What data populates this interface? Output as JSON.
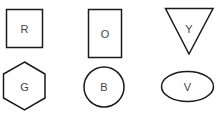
{
  "diagram": {
    "title": "",
    "colors": {
      "stroke": "#1a1a1a",
      "label": "#444444",
      "background": "#ffffff"
    },
    "shapes": [
      {
        "id": "square",
        "type": "square",
        "label": "R",
        "row": 1,
        "col": 1
      },
      {
        "id": "rectangle",
        "type": "rectangle",
        "label": "O",
        "row": 1,
        "col": 2
      },
      {
        "id": "triangle",
        "type": "inverted-triangle",
        "label": "Y",
        "row": 1,
        "col": 3
      },
      {
        "id": "hexagon",
        "type": "hexagon",
        "label": "G",
        "row": 2,
        "col": 1
      },
      {
        "id": "circle",
        "type": "circle",
        "label": "B",
        "row": 2,
        "col": 2
      },
      {
        "id": "ellipse",
        "type": "ellipse",
        "label": "V",
        "row": 2,
        "col": 3
      }
    ]
  }
}
